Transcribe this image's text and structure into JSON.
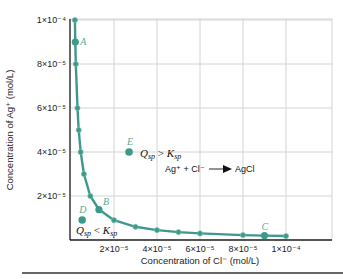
{
  "chart_data": {
    "type": "line",
    "title": "",
    "xlabel": "Concentration of Cl⁻ (mol/L)",
    "ylabel": "Concentration of Ag⁺ (mol/L)",
    "xlim": [
      0,
      0.00011
    ],
    "ylim": [
      0,
      0.0001
    ],
    "grid": true,
    "legend": null,
    "x_ticks": [
      {
        "value": 2e-05,
        "label": "2×10⁻⁵"
      },
      {
        "value": 4e-05,
        "label": "4×10⁻⁵"
      },
      {
        "value": 6e-05,
        "label": "6×10⁻⁵"
      },
      {
        "value": 8e-05,
        "label": "8×10⁻⁵"
      },
      {
        "value": 0.0001,
        "label": "1×10⁻⁴"
      }
    ],
    "y_ticks": [
      {
        "value": 2e-05,
        "label": "2×10⁻⁵"
      },
      {
        "value": 4e-05,
        "label": "4×10⁻⁵"
      },
      {
        "value": 6e-05,
        "label": "6×10⁻⁵"
      },
      {
        "value": 8e-05,
        "label": "8×10⁻⁵"
      },
      {
        "value": 0.0001,
        "label": "1×10⁻⁴"
      }
    ],
    "series": [
      {
        "name": "Ksp curve (AgCl saturation)",
        "color": "#3d9a8b",
        "x": [
          1.8e-06,
          2e-06,
          2.25e-06,
          3e-06,
          3.6e-06,
          4.5e-06,
          6e-06,
          9e-06,
          1.3e-05,
          2e-05,
          3e-05,
          4e-05,
          5e-05,
          6e-05,
          8e-05,
          9e-05,
          0.0001
        ],
        "y": [
          0.0001,
          9e-05,
          8e-05,
          6e-05,
          5e-05,
          4e-05,
          3e-05,
          2e-05,
          1.38e-05,
          9e-06,
          6e-06,
          4.5e-06,
          3.6e-06,
          3e-06,
          2.25e-06,
          2e-06,
          1.8e-06
        ]
      }
    ],
    "points": [
      {
        "label": "A",
        "x": 2e-06,
        "y": 9e-05,
        "on_curve": true
      },
      {
        "label": "B",
        "x": 1.3e-05,
        "y": 1.38e-05,
        "on_curve": true
      },
      {
        "label": "C",
        "x": 9e-05,
        "y": 2e-06,
        "on_curve": true
      },
      {
        "label": "D",
        "x": 5.2e-06,
        "y": 9.1e-06,
        "on_curve": false
      },
      {
        "label": "E",
        "x": 2.7e-05,
        "y": 4e-05,
        "on_curve": false
      }
    ],
    "annotations": [
      {
        "text": "Q_sp > K_sp",
        "near": "E"
      },
      {
        "text": "Ag⁺ + Cl⁻ → AgCl",
        "near": "E"
      },
      {
        "text": "Q_sp < K_sp",
        "near": "D"
      }
    ]
  },
  "labels": {
    "xlabel": "Concentration of Cl⁻ (mol/L)",
    "ylabel": "Concentration of Ag⁺ (mol/L)",
    "anno_gt_Q": "Q",
    "anno_gt_sub": "sp",
    "anno_gt_op": " > ",
    "anno_gt_K": "K",
    "anno_lt_Q": "Q",
    "anno_lt_sub": "sp",
    "anno_lt_op": " < ",
    "anno_lt_K": "K",
    "reaction_left": "Ag⁺ + Cl⁻",
    "reaction_right": "AgCl"
  },
  "style": {
    "curve_color": "#3d9a8b",
    "grid_color": "#d4d4d4",
    "axis_color": "#222222"
  }
}
